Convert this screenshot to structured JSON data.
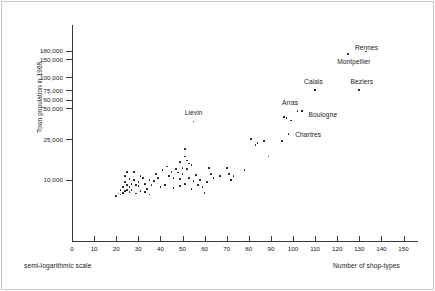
{
  "figure": {
    "background": "#ffffff",
    "axis_color": "#3a3a3a",
    "point_color": "#111111",
    "text_color": "#1a1a1a"
  },
  "chart_data": {
    "type": "scatter",
    "title": "",
    "xlabel": "Number of shop-types",
    "ylabel": "Town population in 1968",
    "note": "semi-logarithmic scale",
    "grid": false,
    "legend": false,
    "xlim": [
      0,
      160
    ],
    "ylim": [
      5000,
      220000
    ],
    "y_scale": "log",
    "x_scale": "linear",
    "xticks": [
      0,
      10,
      20,
      30,
      40,
      50,
      60,
      70,
      80,
      90,
      100,
      110,
      120,
      130,
      140,
      150
    ],
    "xtick_labels": [
      "0",
      "10",
      "20",
      "30",
      "40",
      "50",
      "60",
      "70",
      "80",
      "90",
      "100",
      "110",
      "120",
      "130",
      "140",
      "150"
    ],
    "yticks": [
      10000,
      25000,
      50000,
      60000,
      75000,
      100000,
      150000,
      180000
    ],
    "ytick_labels": [
      "10,000",
      "25,000",
      "50,000",
      "60,000",
      "75,000",
      "100,000",
      "150,000",
      "180,000"
    ],
    "annotations": [
      {
        "label": "Rennes",
        "x": 133,
        "y": 178000,
        "lx": 128,
        "ly": 196000
      },
      {
        "label": "Montpellier",
        "x": 125,
        "y": 168000,
        "lx": 120,
        "ly": 143000
      },
      {
        "label": "Calais",
        "x": 110,
        "y": 75000,
        "lx": 105,
        "ly": 92000
      },
      {
        "label": "Beziers",
        "x": 130,
        "y": 75000,
        "lx": 126,
        "ly": 92000
      },
      {
        "label": "Arras",
        "x": 102,
        "y": 47000,
        "lx": 95,
        "ly": 57000
      },
      {
        "label": "Boulogne",
        "x": 104,
        "y": 47000,
        "lx": 107,
        "ly": 43000
      },
      {
        "label": "Chartres",
        "x": 98,
        "y": 28000,
        "lx": 101,
        "ly": 27500
      },
      {
        "label": "Lievin",
        "x": 55,
        "y": 37000,
        "lx": 51,
        "ly": 45000
      }
    ],
    "points": [
      {
        "x": 133,
        "y": 178000
      },
      {
        "x": 125,
        "y": 168000
      },
      {
        "x": 110,
        "y": 75000
      },
      {
        "x": 130,
        "y": 75000
      },
      {
        "x": 102,
        "y": 47000
      },
      {
        "x": 104,
        "y": 47000
      },
      {
        "x": 96,
        "y": 41000
      },
      {
        "x": 97,
        "y": 40000
      },
      {
        "x": 99,
        "y": 38000
      },
      {
        "x": 98,
        "y": 28000
      },
      {
        "x": 55,
        "y": 37000
      },
      {
        "x": 81,
        "y": 25000
      },
      {
        "x": 84,
        "y": 23000
      },
      {
        "x": 87,
        "y": 24000
      },
      {
        "x": 83,
        "y": 22000
      },
      {
        "x": 95,
        "y": 24000
      },
      {
        "x": 89,
        "y": 17000
      },
      {
        "x": 78,
        "y": 12500
      },
      {
        "x": 51,
        "y": 20000
      },
      {
        "x": 51,
        "y": 17000
      },
      {
        "x": 49,
        "y": 15000
      },
      {
        "x": 52,
        "y": 15500
      },
      {
        "x": 53,
        "y": 14500
      },
      {
        "x": 54,
        "y": 14000
      },
      {
        "x": 50,
        "y": 13000
      },
      {
        "x": 52,
        "y": 12800
      },
      {
        "x": 47,
        "y": 12800
      },
      {
        "x": 45,
        "y": 12000
      },
      {
        "x": 43,
        "y": 13500
      },
      {
        "x": 41,
        "y": 12500
      },
      {
        "x": 44,
        "y": 11000
      },
      {
        "x": 46,
        "y": 10500
      },
      {
        "x": 49,
        "y": 10200
      },
      {
        "x": 53,
        "y": 10500
      },
      {
        "x": 56,
        "y": 11200
      },
      {
        "x": 58,
        "y": 10000
      },
      {
        "x": 55,
        "y": 9800
      },
      {
        "x": 57,
        "y": 9000
      },
      {
        "x": 51,
        "y": 9200
      },
      {
        "x": 49,
        "y": 8800
      },
      {
        "x": 54,
        "y": 8200
      },
      {
        "x": 59,
        "y": 8500
      },
      {
        "x": 61,
        "y": 9500
      },
      {
        "x": 62,
        "y": 13000
      },
      {
        "x": 63,
        "y": 11500
      },
      {
        "x": 60,
        "y": 7500
      },
      {
        "x": 64,
        "y": 10500
      },
      {
        "x": 67,
        "y": 11000
      },
      {
        "x": 70,
        "y": 13000
      },
      {
        "x": 71,
        "y": 11500
      },
      {
        "x": 73,
        "y": 11000
      },
      {
        "x": 72,
        "y": 10000
      },
      {
        "x": 38,
        "y": 11500
      },
      {
        "x": 39,
        "y": 10500
      },
      {
        "x": 37,
        "y": 9800
      },
      {
        "x": 36,
        "y": 9000
      },
      {
        "x": 35,
        "y": 10000
      },
      {
        "x": 34,
        "y": 8200
      },
      {
        "x": 33,
        "y": 9200
      },
      {
        "x": 32,
        "y": 10500
      },
      {
        "x": 31,
        "y": 11000
      },
      {
        "x": 30,
        "y": 9500
      },
      {
        "x": 30,
        "y": 8800
      },
      {
        "x": 29,
        "y": 9000
      },
      {
        "x": 28,
        "y": 10000
      },
      {
        "x": 28,
        "y": 12000
      },
      {
        "x": 27,
        "y": 9200
      },
      {
        "x": 27,
        "y": 8000
      },
      {
        "x": 26,
        "y": 8600
      },
      {
        "x": 26,
        "y": 7600
      },
      {
        "x": 25,
        "y": 9000
      },
      {
        "x": 25,
        "y": 8000
      },
      {
        "x": 24,
        "y": 11000
      },
      {
        "x": 24,
        "y": 9500
      },
      {
        "x": 24,
        "y": 7800
      },
      {
        "x": 23,
        "y": 8500
      },
      {
        "x": 23,
        "y": 7500
      },
      {
        "x": 22,
        "y": 8000
      },
      {
        "x": 22,
        "y": 7200
      },
      {
        "x": 21,
        "y": 7400
      },
      {
        "x": 20,
        "y": 7000
      },
      {
        "x": 29,
        "y": 7400
      },
      {
        "x": 31,
        "y": 7800
      },
      {
        "x": 33,
        "y": 7600
      },
      {
        "x": 35,
        "y": 7200
      },
      {
        "x": 40,
        "y": 8600
      },
      {
        "x": 42,
        "y": 9000
      },
      {
        "x": 46,
        "y": 8400
      },
      {
        "x": 48,
        "y": 11800
      },
      {
        "x": 50,
        "y": 11500
      },
      {
        "x": 26,
        "y": 10200
      },
      {
        "x": 25,
        "y": 12000
      }
    ]
  }
}
